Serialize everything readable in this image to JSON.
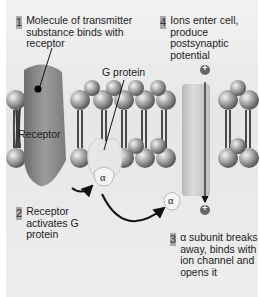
{
  "steps": [
    {
      "number": "1",
      "text": "Molecule of transmitter substance binds with receptor"
    },
    {
      "number": "2",
      "text": "Receptor activates G protein"
    },
    {
      "number": "3",
      "text": "α subunit breaks away, binds with ion channel and opens it"
    },
    {
      "number": "4",
      "text": "Ions enter cell, produce postsynaptic potential"
    }
  ],
  "labels": {
    "receptor": "Receptor",
    "g_protein": "G protein",
    "alpha": "α",
    "plus": "+"
  },
  "colors": {
    "background": "#ececec",
    "receptor": "#8a8a8a",
    "channel": "#c8c8c8",
    "number_box": "#a9a9a9"
  }
}
